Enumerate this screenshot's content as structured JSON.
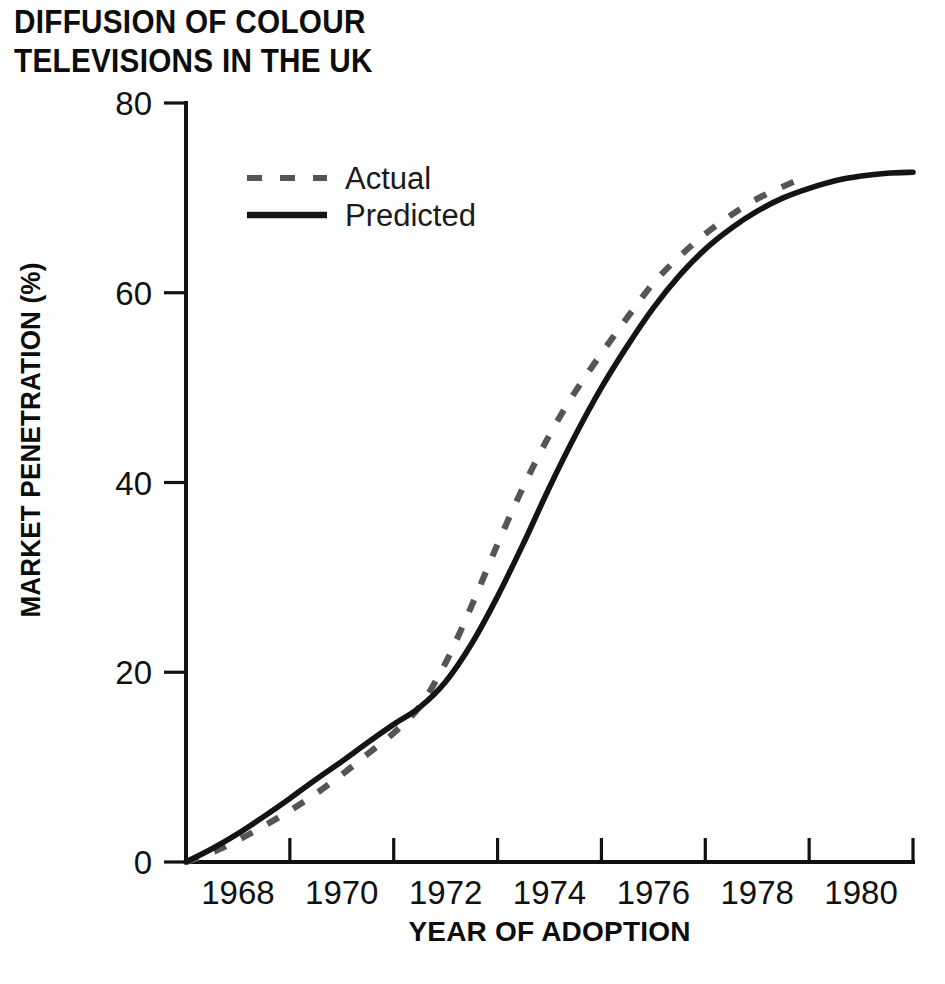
{
  "chart_data": {
    "type": "line",
    "title": "DIFFUSION OF COLOUR\nTELEVISIONS IN THE UK",
    "title_line1": "DIFFUSION OF COLOUR",
    "title_line2": "TELEVISIONS IN THE UK",
    "xlabel": "YEAR OF ADOPTION",
    "ylabel": "MARKET PENETRATION (%)",
    "xlim": [
      1967,
      1981
    ],
    "ylim": [
      0,
      80
    ],
    "grid": false,
    "legend_position": "upper-left-inside",
    "x_ticklabels": [
      "1968",
      "1970",
      "1972",
      "1974",
      "1976",
      "1978",
      "1980"
    ],
    "x_ticklabel_values": [
      1968,
      1970,
      1972,
      1974,
      1976,
      1978,
      1980
    ],
    "x_tickmark_values": [
      1969,
      1971,
      1973,
      1975,
      1977,
      1979,
      1981
    ],
    "y_ticklabels": [
      "0",
      "20",
      "40",
      "60",
      "80"
    ],
    "y_tickvalues": [
      0,
      20,
      40,
      60,
      80
    ],
    "series": [
      {
        "name": "Actual",
        "style": "dashed",
        "color": "#555555",
        "x": [
          1967.0,
          1967.5,
          1968.0,
          1968.5,
          1969.0,
          1969.5,
          1970.0,
          1970.5,
          1971.0,
          1971.5,
          1972.0,
          1972.5,
          1973.0,
          1973.5,
          1974.0,
          1974.5,
          1975.0,
          1975.5,
          1976.0,
          1976.5,
          1977.0,
          1977.5,
          1978.0,
          1978.5,
          1979.0
        ],
        "y": [
          0.0,
          1.0,
          2.3,
          3.8,
          5.4,
          7.2,
          9.2,
          11.4,
          13.6,
          16.4,
          21.0,
          27.0,
          33.5,
          39.6,
          45.0,
          49.6,
          53.6,
          57.4,
          61.0,
          63.8,
          66.2,
          68.2,
          69.9,
          71.2,
          72.4
        ]
      },
      {
        "name": "Predicted",
        "style": "solid",
        "color": "#141414",
        "x": [
          1967.0,
          1967.5,
          1968.0,
          1968.5,
          1969.0,
          1969.5,
          1970.0,
          1970.5,
          1971.0,
          1971.5,
          1972.0,
          1972.5,
          1973.0,
          1973.5,
          1974.0,
          1974.5,
          1975.0,
          1975.5,
          1976.0,
          1976.5,
          1977.0,
          1977.5,
          1978.0,
          1978.5,
          1979.0,
          1979.5,
          1980.0,
          1980.5,
          1981.0
        ],
        "y": [
          0.0,
          1.4,
          3.0,
          4.8,
          6.7,
          8.7,
          10.6,
          12.6,
          14.5,
          16.3,
          19.0,
          23.0,
          28.0,
          33.6,
          39.5,
          45.0,
          50.0,
          54.4,
          58.4,
          61.8,
          64.6,
          66.8,
          68.6,
          70.0,
          71.0,
          71.8,
          72.3,
          72.6,
          72.7
        ]
      }
    ],
    "legend": [
      {
        "label": "Actual",
        "style": "dashed",
        "color": "#555555"
      },
      {
        "label": "Predicted",
        "style": "solid",
        "color": "#141414"
      }
    ]
  },
  "geometry": {
    "plot_left": 186,
    "plot_right": 913,
    "plot_top": 103,
    "plot_bottom": 862
  }
}
